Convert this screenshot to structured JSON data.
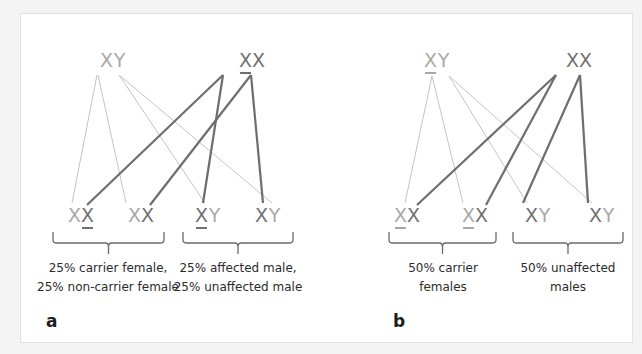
{
  "colors": {
    "background": "#f4f4f4",
    "frame": "#ffffff",
    "light_allele": "#a8a8a8",
    "dark_allele": "#707070",
    "light_line": "#c4c4c4",
    "dark_line": "#6e6e6e",
    "bracket": "#6a6a6a",
    "text": "#2b2b2b"
  },
  "panels": [
    {
      "letter": "a",
      "letter_pos": [
        46,
        327
      ],
      "parents": [
        {
          "id": "father",
          "alleles": [
            {
              "t": "X",
              "c": "light",
              "u": false
            },
            {
              "t": "Y",
              "c": "light",
              "u": false
            }
          ],
          "x": 113,
          "y": 67,
          "underline": null
        },
        {
          "id": "mother",
          "alleles": [
            {
              "t": "X",
              "c": "dark",
              "u": true
            },
            {
              "t": "X",
              "c": "dark",
              "u": false
            }
          ],
          "x": 252,
          "y": 67
        }
      ],
      "children": [
        {
          "alleles": [
            {
              "t": "X",
              "c": "light",
              "u": false
            },
            {
              "t": "X",
              "c": "dark",
              "u": true
            }
          ],
          "x": 81,
          "y": 222
        },
        {
          "alleles": [
            {
              "t": "X",
              "c": "light",
              "u": false
            },
            {
              "t": "X",
              "c": "dark",
              "u": false
            }
          ],
          "x": 141,
          "y": 222
        },
        {
          "alleles": [
            {
              "t": "X",
              "c": "dark",
              "u": true
            },
            {
              "t": "Y",
              "c": "light",
              "u": false
            }
          ],
          "x": 208,
          "y": 222
        },
        {
          "alleles": [
            {
              "t": "X",
              "c": "dark",
              "u": false
            },
            {
              "t": "Y",
              "c": "light",
              "u": false
            }
          ],
          "x": 268,
          "y": 222
        }
      ],
      "lines": [
        {
          "from": [
            97,
            75
          ],
          "to": [
            72,
            203
          ],
          "kind": "light"
        },
        {
          "from": [
            98,
            75
          ],
          "to": [
            126,
            203
          ],
          "kind": "light"
        },
        {
          "from": [
            119,
            75
          ],
          "to": [
            205,
            203
          ],
          "kind": "light"
        },
        {
          "from": [
            119,
            75
          ],
          "to": [
            272,
            203
          ],
          "kind": "light"
        },
        {
          "from": [
            223,
            75
          ],
          "to": [
            87,
            205
          ],
          "kind": "dark"
        },
        {
          "from": [
            223,
            75
          ],
          "to": [
            203,
            203
          ],
          "kind": "dark"
        },
        {
          "from": [
            251,
            75
          ],
          "to": [
            150,
            205
          ],
          "kind": "dark"
        },
        {
          "from": [
            251,
            75
          ],
          "to": [
            263,
            203
          ],
          "kind": "dark"
        }
      ],
      "brackets": [
        {
          "x1": 53,
          "x2": 164,
          "y": 232
        },
        {
          "x1": 183,
          "x2": 293,
          "y": 232
        }
      ],
      "captions": [
        {
          "lines": [
            "25% carrier female,",
            "25% non-carrier female"
          ],
          "x": 108,
          "y": 272
        },
        {
          "lines": [
            "25% affected male,",
            "25% unaffected male"
          ],
          "x": 238,
          "y": 272
        }
      ]
    },
    {
      "letter": "b",
      "letter_pos": [
        393,
        327
      ],
      "parents": [
        {
          "id": "father",
          "alleles": [
            {
              "t": "X",
              "c": "light",
              "u": true
            },
            {
              "t": "Y",
              "c": "light",
              "u": false
            }
          ],
          "x": 437,
          "y": 67
        },
        {
          "id": "mother",
          "alleles": [
            {
              "t": "X",
              "c": "dark",
              "u": false
            },
            {
              "t": "X",
              "c": "dark",
              "u": false
            }
          ],
          "x": 579,
          "y": 67
        }
      ],
      "children": [
        {
          "alleles": [
            {
              "t": "X",
              "c": "light",
              "u": true
            },
            {
              "t": "X",
              "c": "dark",
              "u": false
            }
          ],
          "x": 407,
          "y": 222
        },
        {
          "alleles": [
            {
              "t": "X",
              "c": "light",
              "u": true
            },
            {
              "t": "X",
              "c": "dark",
              "u": false
            }
          ],
          "x": 475,
          "y": 222
        },
        {
          "alleles": [
            {
              "t": "X",
              "c": "dark",
              "u": false
            },
            {
              "t": "Y",
              "c": "light",
              "u": false
            }
          ],
          "x": 538,
          "y": 222
        },
        {
          "alleles": [
            {
              "t": "X",
              "c": "dark",
              "u": false
            },
            {
              "t": "Y",
              "c": "light",
              "u": false
            }
          ],
          "x": 602,
          "y": 222
        }
      ],
      "lines": [
        {
          "from": [
            432,
            76
          ],
          "to": [
            405,
            203
          ],
          "kind": "light"
        },
        {
          "from": [
            432,
            76
          ],
          "to": [
            463,
            203
          ],
          "kind": "light"
        },
        {
          "from": [
            449,
            76
          ],
          "to": [
            527,
            203
          ],
          "kind": "light"
        },
        {
          "from": [
            449,
            76
          ],
          "to": [
            592,
            203
          ],
          "kind": "light"
        },
        {
          "from": [
            556,
            75
          ],
          "to": [
            417,
            205
          ],
          "kind": "dark"
        },
        {
          "from": [
            556,
            75
          ],
          "to": [
            486,
            205
          ],
          "kind": "dark"
        },
        {
          "from": [
            580,
            75
          ],
          "to": [
            523,
            203
          ],
          "kind": "dark"
        },
        {
          "from": [
            580,
            75
          ],
          "to": [
            588,
            203
          ],
          "kind": "dark"
        }
      ],
      "brackets": [
        {
          "x1": 389,
          "x2": 496,
          "y": 232
        },
        {
          "x1": 513,
          "x2": 623,
          "y": 232
        }
      ],
      "captions": [
        {
          "lines": [
            "50% carrier",
            "females"
          ],
          "x": 443,
          "y": 272
        },
        {
          "lines": [
            "50% unaffected",
            "males"
          ],
          "x": 568,
          "y": 272
        }
      ]
    }
  ]
}
